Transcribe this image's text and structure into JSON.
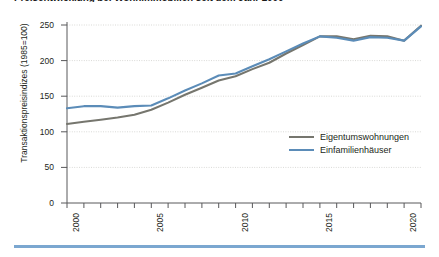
{
  "title": "Preisentwicklung bei Wohnimmobilien seit dem Jahr 2000",
  "chart_data": {
    "type": "line",
    "title": "Preisentwicklung bei Wohnimmobilien seit dem Jahr 2000",
    "xlabel": "",
    "ylabel": "Transaktionspreisindizes (1985=100)",
    "ylim": [
      0,
      250
    ],
    "xlim": [
      2000,
      2021
    ],
    "grid": true,
    "legend_position": "middle-right",
    "y_ticks": [
      0,
      50,
      100,
      150,
      200,
      250
    ],
    "x_ticks": [
      2000,
      2005,
      2010,
      2015,
      2020
    ],
    "x": [
      2000,
      2001,
      2002,
      2003,
      2004,
      2005,
      2006,
      2007,
      2008,
      2009,
      2010,
      2011,
      2012,
      2013,
      2014,
      2015,
      2016,
      2017,
      2018,
      2019,
      2020,
      2021
    ],
    "series": [
      {
        "name": "Eigentumswohnungen",
        "color": "#76766e",
        "values": [
          111,
          114,
          117,
          120,
          124,
          131,
          141,
          152,
          162,
          172,
          178,
          188,
          197,
          210,
          222,
          234,
          234,
          230,
          235,
          234,
          228,
          249
        ]
      },
      {
        "name": "Einfamilienhäuser",
        "color": "#5b8cb8",
        "values": [
          133,
          136,
          136,
          134,
          136,
          137,
          147,
          158,
          168,
          179,
          182,
          192,
          202,
          213,
          224,
          234,
          232,
          228,
          233,
          232,
          228,
          248
        ]
      }
    ]
  },
  "axis": {
    "y_label": "Transaktionspreisindizes (1985=100)",
    "y_tick_labels": [
      "0",
      "50",
      "100",
      "150",
      "200",
      "250"
    ],
    "x_tick_labels": [
      "2000",
      "2005",
      "2010",
      "2015",
      "2020"
    ]
  },
  "legend": {
    "items": [
      {
        "label": "Eigentumswohnungen",
        "color": "#76766e"
      },
      {
        "label": "Einfamilienhäuser",
        "color": "#5b8cb8"
      }
    ]
  },
  "colors": {
    "series_gray": "#76766e",
    "series_blue": "#5b8cb8",
    "grid": "#d9d9d6",
    "axis": "#58585a",
    "bottom_rule": "#7ba7d0",
    "text": "#231f20"
  }
}
